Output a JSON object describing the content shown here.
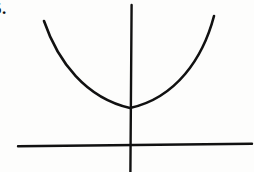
{
  "figure": {
    "kind": "scanned-math-figure",
    "problem_number": "5.",
    "background_color": "#ffffff",
    "ink_color": "#111111",
    "width": 254,
    "height": 172
  },
  "chart_data": {
    "type": "line",
    "title": "",
    "subtitle": "",
    "xlabel": "",
    "ylabel": "",
    "grid": false,
    "legend": null,
    "annotations": [
      {
        "name": "problem-number",
        "text": "5.",
        "x": 4,
        "y": 10
      }
    ],
    "axes": {
      "x_axis": {
        "label": "",
        "orientation": "horizontal",
        "pixel_y": 145,
        "pixel_x_start": 18,
        "pixel_x_end": 252,
        "tick_labels": [],
        "arrowheads": false
      },
      "y_axis": {
        "label": "",
        "orientation": "vertical",
        "pixel_x": 131,
        "pixel_y_start": 5,
        "pixel_y_end": 172,
        "tick_labels": [],
        "arrowheads": false
      },
      "origin": {
        "x": 131,
        "y": 145
      }
    },
    "series": [
      {
        "name": "parabola",
        "shape": "upward-opening parabola",
        "vertex": {
          "x": 130,
          "y": 108
        },
        "left_endpoint": {
          "x": 44,
          "y": 21
        },
        "right_endpoint": {
          "x": 214,
          "y": 16
        },
        "path": "M 44 21 C 58 62, 86 98, 130 108 C 176 98, 203 58, 214 16",
        "closed": false,
        "stroke_width": 2.6
      }
    ],
    "xlim": [
      0,
      254
    ],
    "ylim": [
      0,
      172
    ]
  }
}
